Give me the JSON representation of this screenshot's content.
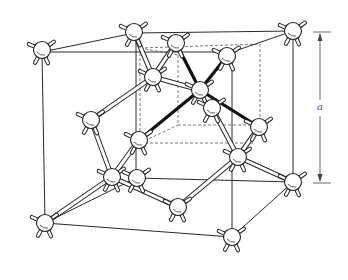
{
  "figure": {
    "dimension_label": "a",
    "colors": {
      "line": "#2a2a2a",
      "highlight_bond": "#111111",
      "atom_fill": "#ffffff",
      "background": "#ffffff"
    }
  },
  "cube": {
    "outer_front_top_left": [
      42,
      52
    ],
    "outer_back_top_left": [
      134,
      33
    ],
    "outer_back_top_right": [
      293,
      33
    ],
    "outer_front_top_right": [
      232,
      52
    ],
    "outer_front_bottom_left": [
      45,
      223
    ],
    "outer_front_bottom_right": [
      232,
      237
    ],
    "outer_back_bottom_right": [
      293,
      183
    ],
    "outer_back_bottom_left": [
      136,
      178
    ]
  },
  "atoms": [
    {
      "id": "c-ftl",
      "x": 42,
      "y": 50,
      "kind": "corner"
    },
    {
      "id": "c-btl",
      "x": 134,
      "y": 32,
      "kind": "corner"
    },
    {
      "id": "c-btr",
      "x": 293,
      "y": 31,
      "kind": "corner"
    },
    {
      "id": "c-fbl",
      "x": 45,
      "y": 223,
      "kind": "corner"
    },
    {
      "id": "c-fbr",
      "x": 232,
      "y": 237,
      "kind": "corner"
    },
    {
      "id": "c-bbr",
      "x": 293,
      "y": 182,
      "kind": "corner"
    },
    {
      "id": "f-top-back",
      "x": 176,
      "y": 43,
      "kind": "face"
    },
    {
      "id": "f-top-right",
      "x": 227,
      "y": 56,
      "kind": "face"
    },
    {
      "id": "i-upper-left",
      "x": 153,
      "y": 77,
      "kind": "interior"
    },
    {
      "id": "i-center",
      "x": 200,
      "y": 90,
      "kind": "interior"
    },
    {
      "id": "i-behind",
      "x": 212,
      "y": 108,
      "kind": "face"
    },
    {
      "id": "f-left",
      "x": 91,
      "y": 120,
      "kind": "face"
    },
    {
      "id": "f-right",
      "x": 259,
      "y": 127,
      "kind": "face"
    },
    {
      "id": "i-left-mid",
      "x": 139,
      "y": 140,
      "kind": "interior"
    },
    {
      "id": "i-right-low",
      "x": 238,
      "y": 157,
      "kind": "interior"
    },
    {
      "id": "i-low-left",
      "x": 112,
      "y": 177,
      "kind": "interior"
    },
    {
      "id": "f-back-low",
      "x": 137,
      "y": 178,
      "kind": "face"
    },
    {
      "id": "f-bottom",
      "x": 178,
      "y": 207,
      "kind": "face"
    }
  ],
  "bonds": [
    [
      "c-btl",
      "i-upper-left"
    ],
    [
      "f-top-back",
      "i-upper-left"
    ],
    [
      "i-upper-left",
      "f-left"
    ],
    [
      "i-upper-left",
      "i-center"
    ],
    [
      "f-left",
      "i-low-left"
    ],
    [
      "i-left-mid",
      "i-low-left"
    ],
    [
      "i-low-left",
      "c-fbl"
    ],
    [
      "i-low-left",
      "f-bottom"
    ],
    [
      "f-bottom",
      "i-right-low"
    ],
    [
      "i-right-low",
      "c-bbr"
    ],
    [
      "i-right-low",
      "f-right"
    ],
    [
      "i-behind",
      "i-right-low"
    ]
  ],
  "highlight_bonds": [
    [
      "i-center",
      "f-top-back"
    ],
    [
      "i-center",
      "f-top-right"
    ],
    [
      "i-center",
      "i-left-mid"
    ],
    [
      "i-center",
      "f-right"
    ]
  ]
}
